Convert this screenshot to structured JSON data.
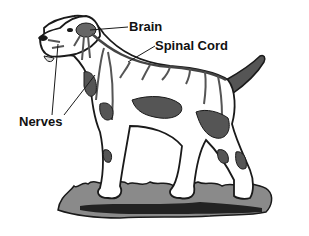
{
  "labels": {
    "brain": "Brain",
    "spinal_cord": "Spinal Cord",
    "nerves": "Nerves"
  },
  "colors": {
    "outline": "#1a1a1a",
    "spots": "#555555",
    "nerve": "#6a6a6a",
    "grass": "#777777"
  }
}
